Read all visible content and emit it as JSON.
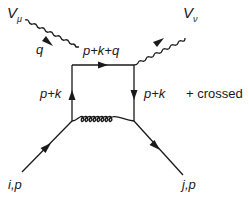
{
  "diagram": {
    "type": "feynman-diagram",
    "external_bosons": [
      {
        "id": "V_mu",
        "symbol": "V",
        "subscript": "μ",
        "momentum_label": "q",
        "direction": "incoming"
      },
      {
        "id": "V_nu",
        "symbol": "V",
        "subscript": "ν",
        "direction": "outgoing"
      }
    ],
    "external_fermions": [
      {
        "id": "incoming",
        "label": "i,p",
        "direction": "incoming"
      },
      {
        "id": "outgoing",
        "label": "j,p",
        "direction": "outgoing"
      }
    ],
    "internal_lines": {
      "top": {
        "label": "p+k+q",
        "type": "fermion",
        "arrow": "right"
      },
      "left": {
        "label": "p+k",
        "type": "fermion",
        "arrow": "up"
      },
      "right": {
        "label": "p+k",
        "type": "fermion",
        "arrow": "down"
      },
      "bottom": {
        "type": "gluon",
        "loops": 7
      }
    },
    "annotation": "+ crossed"
  },
  "labels": {
    "v_mu_symbol": "V",
    "v_mu_sub": "μ",
    "v_nu_symbol": "V",
    "v_nu_sub": "ν",
    "q": "q",
    "top_momentum": "p+k+q",
    "left_momentum": "p+k",
    "right_momentum": "p+k",
    "crossed": "+ crossed",
    "incoming": "i,p",
    "outgoing": "j,p"
  },
  "colors": {
    "line": "#1a1a1a",
    "background": "#ffffff"
  }
}
